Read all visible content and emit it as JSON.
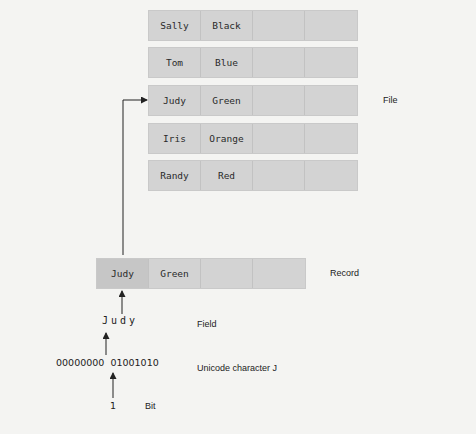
{
  "file": {
    "label": "File",
    "records": [
      {
        "name": "Sally",
        "color": "Black"
      },
      {
        "name": "Tom",
        "color": "Blue"
      },
      {
        "name": "Judy",
        "color": "Green"
      },
      {
        "name": "Iris",
        "color": "Orange"
      },
      {
        "name": "Randy",
        "color": "Red"
      }
    ]
  },
  "record": {
    "label": "Record",
    "name": "Judy",
    "color": "Green"
  },
  "field": {
    "label": "Field",
    "value": "Judy"
  },
  "character": {
    "label": "Unicode character J",
    "bits": "00000000  01001010"
  },
  "bit": {
    "label": "Bit",
    "value": "1"
  },
  "colors": {
    "background": "#f4f4f2",
    "cell": "#d3d3d3",
    "highlighted_cell": "#c6c6c6",
    "line": "#222222"
  }
}
